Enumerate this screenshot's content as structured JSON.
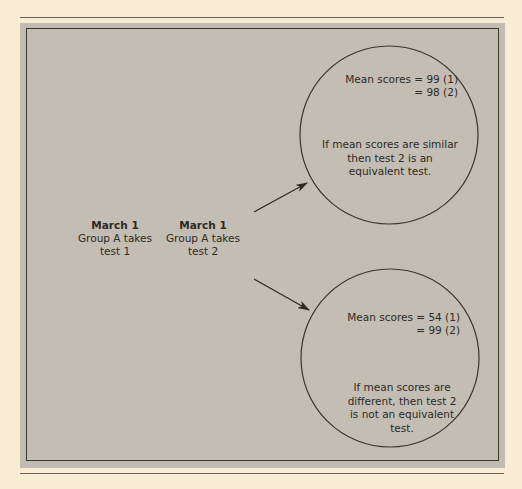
{
  "steps": [
    {
      "date": "March 1",
      "line1": "Group A takes",
      "line2": "test 1"
    },
    {
      "date": "March 1",
      "line1": "Group A takes",
      "line2": "test 2"
    }
  ],
  "outcomes": [
    {
      "mean_line1": "Mean scores  =  99 (1)",
      "mean_line2": "=  98 (2)",
      "conclusion": [
        "If mean scores are similar",
        "then test 2 is an",
        "equivalent test."
      ]
    },
    {
      "mean_line1": "Mean scores  =  54 (1)",
      "mean_line2": "=  99 (2)",
      "conclusion": [
        "If mean scores are",
        "different, then test 2",
        "is not an equivalent",
        "test."
      ]
    }
  ],
  "colors": {
    "page": "#f8ecd4",
    "panel": "#c3bdb3",
    "ink": "#2e2a26"
  }
}
